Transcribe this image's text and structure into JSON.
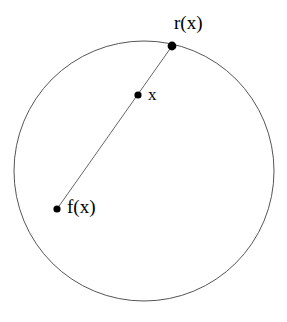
{
  "figure": {
    "kind": "geometric-diagram",
    "background_color": "#ffffff",
    "width": 287,
    "height": 322
  },
  "shapes": {
    "circle": {
      "name": "boundary-circle",
      "cx": 144,
      "cy": 171,
      "r": 130,
      "stroke_color": "#555555",
      "stroke_width": 1,
      "fill": "none"
    },
    "ray": {
      "name": "ray-segment",
      "x1": 57,
      "y1": 209,
      "x2": 172,
      "y2": 46,
      "stroke_color": "#666666",
      "stroke_width": 1
    }
  },
  "points": [
    {
      "id": "rx",
      "label": "r(x)",
      "cx": 172,
      "cy": 46,
      "radius": 4.4,
      "color": "#000000"
    },
    {
      "id": "x",
      "label": "x",
      "cx": 138,
      "cy": 95,
      "radius": 3.6,
      "color": "#000000"
    },
    {
      "id": "fx",
      "label": "f(x)",
      "cx": 57,
      "cy": 209,
      "radius": 3.6,
      "color": "#000000"
    }
  ],
  "labels": {
    "rx": "r(x)",
    "x": "x",
    "fx": "f(x)"
  }
}
